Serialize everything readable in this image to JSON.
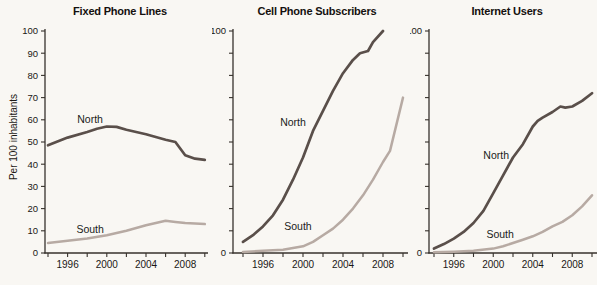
{
  "figure": {
    "width": 597,
    "height": 285,
    "ylabel": "Per 100 inhabitants",
    "colors": {
      "north": "#5a4f4a",
      "south": "#b7aaa3",
      "axis": "#37322d",
      "text": "#1b1715",
      "background": "#f9f7f3"
    }
  },
  "chart_data": [
    {
      "type": "line",
      "title": "Fixed Phone Lines",
      "xlabel": "",
      "ylabel": "Per 100 inhabitants",
      "ylim": [
        0,
        100
      ],
      "xlim": [
        1994,
        2010
      ],
      "grid": false,
      "legend": "inline-labels",
      "x_tick_labels": [
        "1996",
        "2000",
        "2004",
        "2008"
      ],
      "y_tick_labels": [
        "0",
        "10",
        "20",
        "30",
        "40",
        "50",
        "60",
        "70",
        "80",
        "90",
        "100"
      ],
      "series": [
        {
          "name": "North",
          "color_key": "north",
          "x": [
            1994,
            1996,
            1998,
            1999,
            2000,
            2001,
            2002,
            2004,
            2006,
            2007,
            2008,
            2009,
            2010
          ],
          "values": [
            48.5,
            52,
            54.5,
            56,
            57,
            56.8,
            55.5,
            53.5,
            51,
            50,
            44,
            42.5,
            42
          ],
          "label_at": [
            1998.3,
            60
          ]
        },
        {
          "name": "South",
          "color_key": "south",
          "x": [
            1994,
            1996,
            1998,
            2000,
            2002,
            2004,
            2005,
            2006,
            2007,
            2008,
            2010
          ],
          "values": [
            4.5,
            5.5,
            6.5,
            8,
            10,
            12.5,
            13.5,
            14.5,
            14,
            13.5,
            13
          ],
          "label_at": [
            1998.3,
            10.5
          ]
        }
      ]
    },
    {
      "type": "line",
      "title": "Cell Phone Subscribers",
      "xlabel": "",
      "ylabel": "",
      "ylim": [
        0,
        100
      ],
      "xlim": [
        1994,
        2010
      ],
      "grid": false,
      "legend": "inline-labels",
      "x_tick_labels": [
        "1996",
        "2000",
        "2004",
        "2008"
      ],
      "y_tick_labels": [
        "0",
        "100"
      ],
      "series": [
        {
          "name": "North",
          "color_key": "north",
          "x": [
            1994,
            1995,
            1996,
            1997,
            1998,
            1999,
            2000,
            2001,
            2002,
            2003,
            2004,
            2005,
            2005.7,
            2006.5,
            2007,
            2008
          ],
          "values": [
            5,
            8,
            12,
            17,
            24,
            33,
            43,
            55,
            64,
            73,
            81,
            87,
            90,
            91,
            95,
            100
          ],
          "label_at": [
            1999,
            59
          ]
        },
        {
          "name": "South",
          "color_key": "south",
          "x": [
            1994,
            1996,
            1998,
            2000,
            2001,
            2002,
            2003,
            2004,
            2005,
            2006,
            2007,
            2008,
            2008.7,
            2010
          ],
          "values": [
            0.5,
            1,
            1.5,
            3,
            5,
            8,
            11,
            15,
            20,
            26,
            33,
            41,
            46,
            70
          ],
          "label_at": [
            1999.5,
            12
          ]
        }
      ]
    },
    {
      "type": "line",
      "title": "Internet Users",
      "xlabel": "",
      "ylabel": "",
      "ylim": [
        0,
        100
      ],
      "xlim": [
        1994,
        2010
      ],
      "grid": false,
      "legend": "inline-labels",
      "x_tick_labels": [
        "1996",
        "2000",
        "2004",
        "2008"
      ],
      "y_tick_labels": [
        "0",
        "100"
      ],
      "series": [
        {
          "name": "North",
          "color_key": "north",
          "x": [
            1994,
            1995,
            1996,
            1997,
            1998,
            1999,
            2000,
            2001,
            2002,
            2003,
            2004,
            2004.5,
            2005,
            2006,
            2006.8,
            2007.3,
            2008,
            2009,
            2010
          ],
          "values": [
            2,
            4,
            6.5,
            9.5,
            13.5,
            19,
            27,
            35,
            43,
            49,
            57,
            59.5,
            61,
            63.5,
            66,
            65.5,
            66,
            68.5,
            72
          ],
          "label_at": [
            2000.3,
            44
          ]
        },
        {
          "name": "South",
          "color_key": "south",
          "x": [
            1994,
            1996,
            1998,
            2000,
            2001,
            2002,
            2003,
            2004,
            2005,
            2006,
            2007,
            2008,
            2009,
            2010
          ],
          "values": [
            0.3,
            0.6,
            1,
            2,
            3,
            4.5,
            6,
            7.5,
            9.5,
            12,
            14,
            17,
            21,
            26
          ],
          "label_at": [
            2000.7,
            8.5
          ]
        }
      ]
    }
  ]
}
